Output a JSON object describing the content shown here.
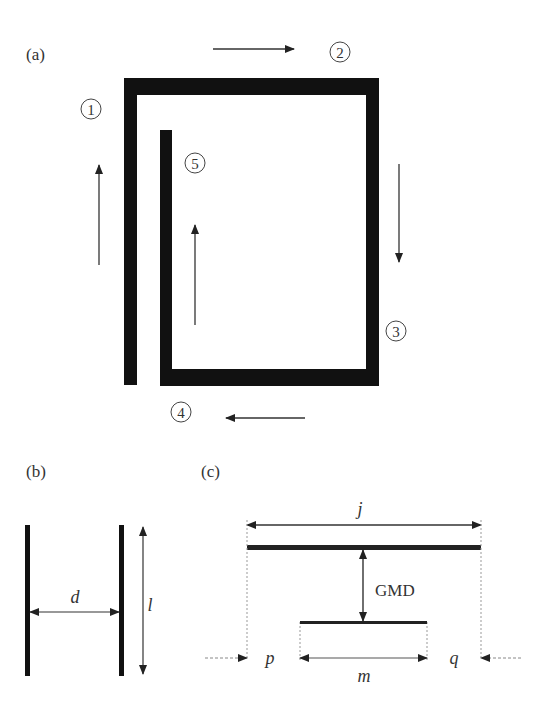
{
  "panels": {
    "a": {
      "label": "(a)",
      "segments": [
        {
          "id": "1",
          "label": "1",
          "direction": "up"
        },
        {
          "id": "2",
          "label": "2",
          "direction": "right"
        },
        {
          "id": "3",
          "label": "3",
          "direction": "down"
        },
        {
          "id": "4",
          "label": "4",
          "direction": "left"
        },
        {
          "id": "5",
          "label": "5",
          "direction": "up"
        }
      ]
    },
    "b": {
      "label": "(b)",
      "distance_label": "d",
      "length_label": "l"
    },
    "c": {
      "label": "(c)",
      "upper_length_label": "j",
      "lower_length_label": "m",
      "separation_label": "GMD",
      "left_offset_label": "p",
      "right_offset_label": "q"
    }
  },
  "colors": {
    "conductor": "#111111",
    "arrow": "#333333",
    "dashed": "#888888"
  }
}
